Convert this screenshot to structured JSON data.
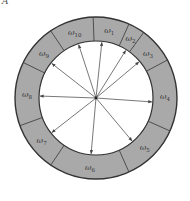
{
  "figure": {
    "corner_mark": "A",
    "center": [
      96,
      98
    ],
    "outer_radius": 81,
    "inner_radius": 57,
    "ring_fill": "#a9a9a9",
    "ring_stroke": "#333333",
    "arrow_color": "#555555",
    "segments": [
      {
        "label": "ω",
        "sub": "1",
        "start": -92,
        "end": -66
      },
      {
        "label": "ω",
        "sub": "2",
        "start": -66,
        "end": -54
      },
      {
        "label": "ω",
        "sub": "3",
        "start": -54,
        "end": -28
      },
      {
        "label": "ω",
        "sub": "4",
        "start": -28,
        "end": 24
      },
      {
        "label": "ω",
        "sub": "5",
        "start": 24,
        "end": 66
      },
      {
        "label": "ω",
        "sub": "6",
        "start": 66,
        "end": 124
      },
      {
        "label": "ω",
        "sub": "7",
        "start": 124,
        "end": 160
      },
      {
        "label": "ω",
        "sub": "8",
        "start": 160,
        "end": 206
      },
      {
        "label": "ω",
        "sub": "9",
        "start": 206,
        "end": 236
      },
      {
        "label": "ω",
        "sub": "10",
        "start": 236,
        "end": 268
      }
    ],
    "arrows": [
      -84,
      -58,
      -40,
      4,
      50,
      95,
      142,
      182,
      218,
      252
    ]
  }
}
